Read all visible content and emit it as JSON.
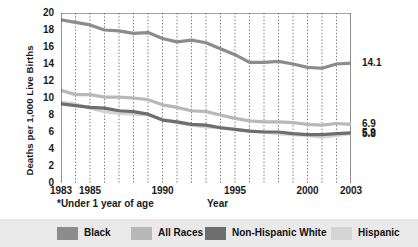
{
  "chart_data": {
    "type": "line",
    "title": "",
    "xlabel": "Year",
    "ylabel": "Deaths per 1,000 Live Births",
    "footnote": "*Under 1 year of age",
    "xlim": [
      1983,
      2003
    ],
    "ylim": [
      0,
      20
    ],
    "ytick_step": 2,
    "yticks": [
      "20",
      "18",
      "16",
      "14",
      "12",
      "10",
      "8",
      "6",
      "4",
      "2",
      "0"
    ],
    "xticks": [
      "1983",
      "1985",
      "1990",
      "1995",
      "2000",
      "2003"
    ],
    "xtick_years": [
      1983,
      1985,
      1990,
      1995,
      2000,
      2003
    ],
    "grid": "vertical-dotted-every-year",
    "legend_position": "bottom",
    "x": [
      1983,
      1984,
      1985,
      1986,
      1987,
      1988,
      1989,
      1990,
      1991,
      1992,
      1993,
      1994,
      1995,
      1996,
      1997,
      1998,
      1999,
      2000,
      2001,
      2002,
      2003
    ],
    "series": [
      {
        "name": "Black",
        "color": "#8c8c8c",
        "end_label": "14.1",
        "values": [
          19.2,
          18.9,
          18.6,
          18.0,
          17.9,
          17.6,
          17.7,
          17.0,
          16.6,
          16.8,
          16.5,
          15.8,
          15.1,
          14.2,
          14.2,
          14.3,
          14.0,
          13.6,
          13.5,
          14.0,
          14.1
        ]
      },
      {
        "name": "All Races",
        "color": "#b8b8b8",
        "end_label": "6.9",
        "values": [
          10.9,
          10.4,
          10.4,
          10.1,
          10.1,
          10.0,
          9.8,
          9.2,
          8.9,
          8.5,
          8.4,
          8.0,
          7.6,
          7.3,
          7.2,
          7.2,
          7.1,
          6.9,
          6.8,
          7.0,
          6.9
        ]
      },
      {
        "name": "Non-Hispanic White",
        "color": "#6e6e6e",
        "end_label": "5.9",
        "values": [
          9.3,
          9.1,
          8.9,
          8.8,
          8.5,
          8.4,
          8.1,
          7.4,
          7.2,
          6.9,
          6.8,
          6.5,
          6.3,
          6.1,
          6.0,
          6.0,
          5.8,
          5.7,
          5.7,
          5.8,
          5.9
        ]
      },
      {
        "name": "Hispanic",
        "color": "#d4d4d4",
        "end_label": "5.8",
        "values": [
          9.5,
          9.3,
          8.8,
          8.4,
          8.2,
          8.1,
          8.0,
          7.5,
          7.1,
          6.8,
          6.6,
          6.5,
          6.3,
          6.1,
          6.0,
          5.8,
          5.7,
          5.6,
          5.4,
          5.6,
          5.8
        ]
      }
    ]
  },
  "legend": {
    "items": [
      {
        "label": "Black",
        "color": "#8c8c8c"
      },
      {
        "label": "All Races",
        "color": "#b8b8b8"
      },
      {
        "label": "Non-Hispanic White",
        "color": "#6e6e6e"
      },
      {
        "label": "Hispanic",
        "color": "#d4d4d4"
      }
    ]
  }
}
